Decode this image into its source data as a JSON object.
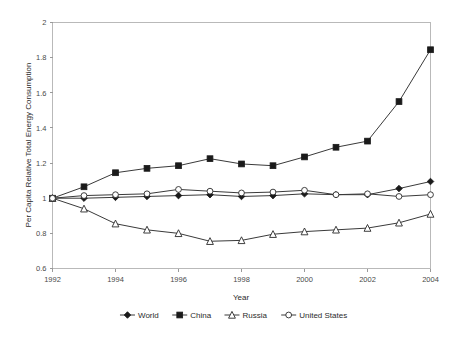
{
  "chart_data": {
    "type": "line",
    "title": "",
    "subtitle": "",
    "xlabel": "Year",
    "ylabel": "Per Capita Relative Total Energy Consumption",
    "x": [
      1992,
      1993,
      1994,
      1995,
      1996,
      1997,
      1998,
      1999,
      2000,
      2001,
      2002,
      2003,
      2004
    ],
    "categories": [
      "1992",
      "1993",
      "1994",
      "1995",
      "1996",
      "1997",
      "1998",
      "1999",
      "2000",
      "2001",
      "2002",
      "2003",
      "2004"
    ],
    "xlim": [
      1992,
      2004
    ],
    "ylim": [
      0.6,
      2.0
    ],
    "xticks": [
      1992,
      1994,
      1996,
      1998,
      2000,
      2002,
      2004
    ],
    "xtick_labels": [
      "1992",
      "1994",
      "1996",
      "1998",
      "2000",
      "2002",
      "2004"
    ],
    "yticks": [
      0.6,
      0.8,
      1.0,
      1.2,
      1.4,
      1.6,
      1.8,
      2.0
    ],
    "ytick_labels": [
      "0.6",
      "0.8",
      "1",
      "1.2",
      "1.4",
      "1.6",
      "1.8",
      "2"
    ],
    "grid": false,
    "legend_position": "bottom",
    "series": [
      {
        "name": "World",
        "marker": "filled-diamond",
        "color": "#1a1a1a",
        "values": [
          1.0,
          1.0,
          1.005,
          1.01,
          1.015,
          1.02,
          1.01,
          1.015,
          1.025,
          1.02,
          1.02,
          1.055,
          1.095
        ]
      },
      {
        "name": "China",
        "marker": "filled-square",
        "color": "#1a1a1a",
        "values": [
          1.0,
          1.065,
          1.145,
          1.17,
          1.185,
          1.225,
          1.195,
          1.185,
          1.235,
          1.29,
          1.325,
          1.55,
          1.845
        ]
      },
      {
        "name": "Russia",
        "marker": "open-triangle",
        "color": "#2a2a2a",
        "values": [
          1.0,
          0.94,
          0.855,
          0.82,
          0.8,
          0.755,
          0.76,
          0.795,
          0.81,
          0.82,
          0.83,
          0.86,
          0.91
        ]
      },
      {
        "name": "United States",
        "marker": "open-circle",
        "color": "#2a2a2a",
        "values": [
          1.0,
          1.015,
          1.02,
          1.025,
          1.05,
          1.04,
          1.03,
          1.035,
          1.045,
          1.02,
          1.025,
          1.01,
          1.02
        ]
      }
    ]
  },
  "legend": {
    "items": [
      {
        "label": "World",
        "marker": "filled-diamond"
      },
      {
        "label": "China",
        "marker": "filled-square"
      },
      {
        "label": "Russia",
        "marker": "open-triangle"
      },
      {
        "label": "United States",
        "marker": "open-circle"
      }
    ]
  },
  "axes": {
    "x_title": "Year",
    "y_title": "Per Capita Relative Total Energy Consumption"
  },
  "colors": {
    "background": "#ffffff",
    "axis": "#b9b9b9",
    "line": "#3a3a3a",
    "marker_fill": "#1a1a1a",
    "marker_open_fill": "#ffffff",
    "text": "#2b2b2b"
  }
}
